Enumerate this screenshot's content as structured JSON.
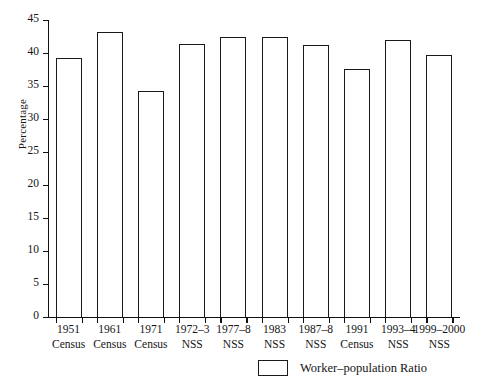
{
  "chart_data": {
    "type": "bar",
    "title": "",
    "xlabel": "",
    "ylabel": "Percentage",
    "ylim": [
      0,
      45
    ],
    "yticks": [
      0,
      5,
      10,
      15,
      20,
      25,
      30,
      35,
      40,
      45
    ],
    "grid": false,
    "legend_position": "bottom-right",
    "categories": [
      "1951 Census",
      "1961 Census",
      "1971 Census",
      "1972–3 NSS",
      "1977–8 NSS",
      "1983 NSS",
      "1987–8 NSS",
      "1991 Census",
      "1993–4 NSS",
      "1999–2000 NSS"
    ],
    "category_lines": [
      {
        "line1": "1951",
        "line2": "Census"
      },
      {
        "line1": "1961",
        "line2": "Census"
      },
      {
        "line1": "1971",
        "line2": "Census"
      },
      {
        "line1": "1972–3",
        "line2": "NSS"
      },
      {
        "line1": "1977–8",
        "line2": "NSS"
      },
      {
        "line1": "1983",
        "line2": "NSS"
      },
      {
        "line1": "1987–8",
        "line2": "NSS"
      },
      {
        "line1": "1991",
        "line2": "Census"
      },
      {
        "line1": "1993–4",
        "line2": "NSS"
      },
      {
        "line1": "1999–2000",
        "line2": "NSS"
      }
    ],
    "series": [
      {
        "name": "Worker–population Ratio",
        "values": [
          39.1,
          43.0,
          34.0,
          41.2,
          42.2,
          42.2,
          41.0,
          37.4,
          41.8,
          39.5
        ]
      }
    ],
    "bar_style": {
      "fill": "#ffffff",
      "edge": "#1a1a1a"
    }
  },
  "legend": {
    "label": "Worker–population Ratio",
    "swatch_name": "legend-swatch-worker-population-ratio"
  },
  "axis": {
    "y_title": "Percentage"
  }
}
